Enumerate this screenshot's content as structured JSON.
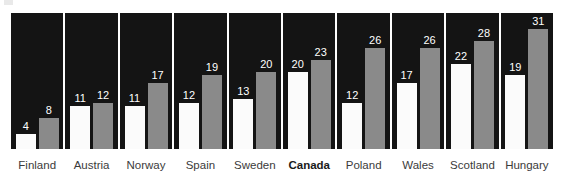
{
  "chart_data": {
    "type": "bar",
    "title": "",
    "subtitle": "",
    "xlabel": "",
    "ylabel": "",
    "ylim": [
      0,
      31
    ],
    "grid": false,
    "legend_position": "none",
    "categories": [
      "Finland",
      "Austria",
      "Norway",
      "Spain",
      "Sweden",
      "Canada",
      "Poland",
      "Wales",
      "Scotland",
      "Hungary"
    ],
    "highlight_category": "Canada",
    "series": [
      {
        "name": "series-white",
        "color": "#fbfbfb",
        "values": [
          4,
          11,
          11,
          12,
          13,
          20,
          12,
          17,
          22,
          19
        ]
      },
      {
        "name": "series-gray",
        "color": "#8a8a8a",
        "values": [
          8,
          12,
          17,
          19,
          20,
          23,
          26,
          26,
          28,
          31
        ]
      }
    ],
    "panels": [
      {
        "label": "Finland",
        "bold": false,
        "white": 4,
        "gray": 8
      },
      {
        "label": "Austria",
        "bold": false,
        "white": 11,
        "gray": 12
      },
      {
        "label": "Norway",
        "bold": false,
        "white": 11,
        "gray": 17
      },
      {
        "label": "Spain",
        "bold": false,
        "white": 12,
        "gray": 19
      },
      {
        "label": "Sweden",
        "bold": false,
        "white": 13,
        "gray": 20
      },
      {
        "label": "Canada",
        "bold": true,
        "white": 20,
        "gray": 23
      },
      {
        "label": "Poland",
        "bold": false,
        "white": 12,
        "gray": 26
      },
      {
        "label": "Wales",
        "bold": false,
        "white": 17,
        "gray": 26
      },
      {
        "label": "Scotland",
        "bold": false,
        "white": 22,
        "gray": 28
      },
      {
        "label": "Hungary",
        "bold": false,
        "white": 19,
        "gray": 31
      }
    ]
  },
  "colors": {
    "panel_background": "#141414",
    "bar_white": "#fbfbfb",
    "bar_gray": "#8a8a8a",
    "value_text": "#ffffff",
    "label_text": "#3b3b3b",
    "page_background": "#ffffff"
  }
}
